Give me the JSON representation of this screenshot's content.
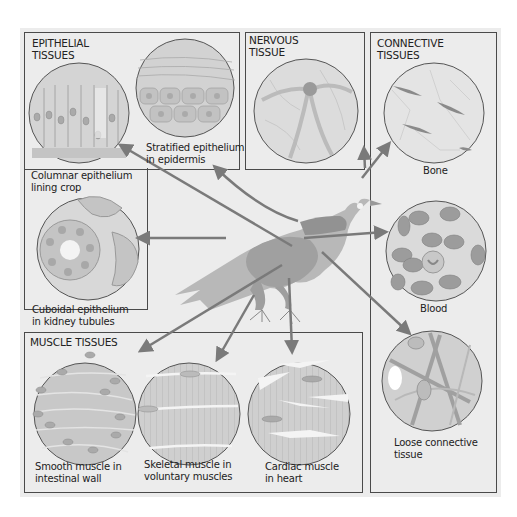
{
  "sections": {
    "epithelial": {
      "title_line1": "EPITHELIAL",
      "title_line2": "TISSUES",
      "items": [
        {
          "caption_line1": "Columnar epithelium",
          "caption_line2": "lining crop"
        },
        {
          "caption_line1": "Stratified epithelium",
          "caption_line2": "in epidermis"
        },
        {
          "caption_line1": "Cuboidal epithelium",
          "caption_line2": "in kidney tubules"
        }
      ]
    },
    "nervous": {
      "title_line1": "NERVOUS",
      "title_line2": "TISSUE"
    },
    "connective": {
      "title_line1": "CONNECTIVE",
      "title_line2": "TISSUES",
      "items": [
        {
          "caption_line1": "Bone"
        },
        {
          "caption_line1": "Blood"
        },
        {
          "caption_line1": "Loose connective",
          "caption_line2": "tissue"
        }
      ]
    },
    "muscle": {
      "title": "MUSCLE TISSUES",
      "items": [
        {
          "caption_line1": "Smooth muscle in",
          "caption_line2": "intestinal wall"
        },
        {
          "caption_line1": "Skeletal muscle in",
          "caption_line2": "voluntary muscles"
        },
        {
          "caption_line1": "Cardiac muscle",
          "caption_line2": "in heart"
        }
      ]
    }
  },
  "center_figure": "bird",
  "colors": {
    "panel_bg": "#ececec",
    "border": "#4a4a4a",
    "arrow": "#7a7a7a",
    "bird": "#b5b5b5",
    "tissue_fill": "#d6d6d6"
  }
}
